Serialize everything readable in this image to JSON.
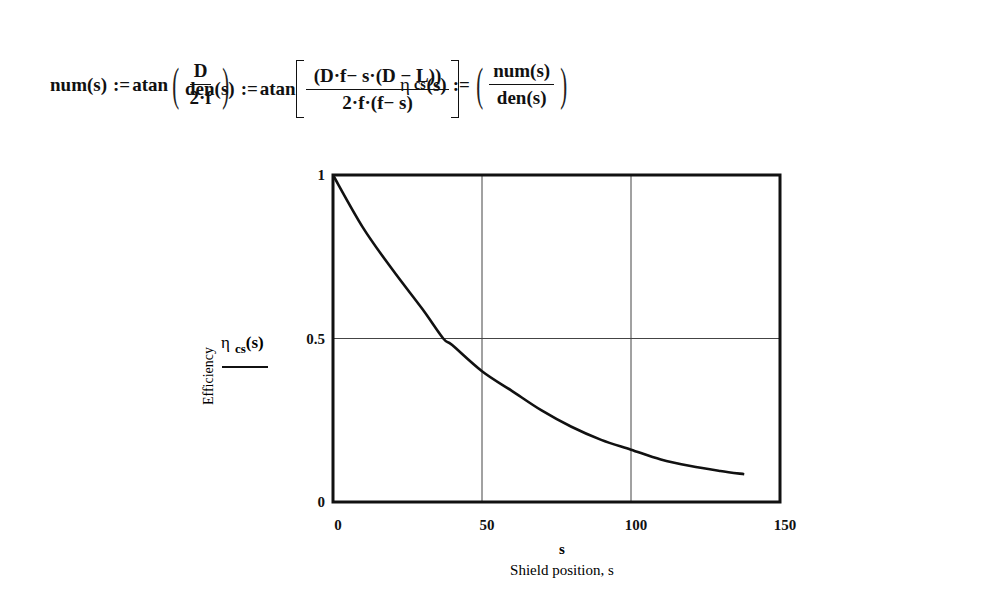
{
  "equations": {
    "num": {
      "lhs": "num(s)",
      "assign": ":=",
      "func": "atan",
      "numerator": "D",
      "denominator": "2·f"
    },
    "den": {
      "lhs": "den(s)",
      "assign": ":=",
      "func": "atan",
      "numerator": "(D·f− s·(D − L))",
      "denominator": "2·f·(f− s)"
    },
    "eta": {
      "symbol": "η",
      "subscript": "cs",
      "arg": "(s)",
      "assign": ":=",
      "numerator": "num(s)",
      "denominator": "den(s)"
    }
  },
  "chart_data": {
    "type": "line",
    "title": "",
    "xlabel": "s",
    "xlabel_caption": "Shield position, s",
    "ylabel": "Efficiency",
    "legend": [
      {
        "name": "η cs(s)",
        "style": "solid"
      }
    ],
    "xlim": [
      0,
      150
    ],
    "ylim": [
      0,
      1
    ],
    "xticks": [
      "0",
      "50",
      "100",
      "150"
    ],
    "yticks": [
      "0",
      "0.5",
      "1"
    ],
    "grid": true,
    "series": [
      {
        "name": "η cs(s)",
        "x": [
          0,
          10,
          20,
          30,
          37,
          40,
          50,
          60,
          70,
          80,
          90,
          100,
          110,
          120,
          130,
          138
        ],
        "y": [
          1.0,
          0.84,
          0.71,
          0.59,
          0.5,
          0.48,
          0.4,
          0.34,
          0.28,
          0.23,
          0.19,
          0.16,
          0.13,
          0.11,
          0.095,
          0.085
        ]
      }
    ]
  }
}
